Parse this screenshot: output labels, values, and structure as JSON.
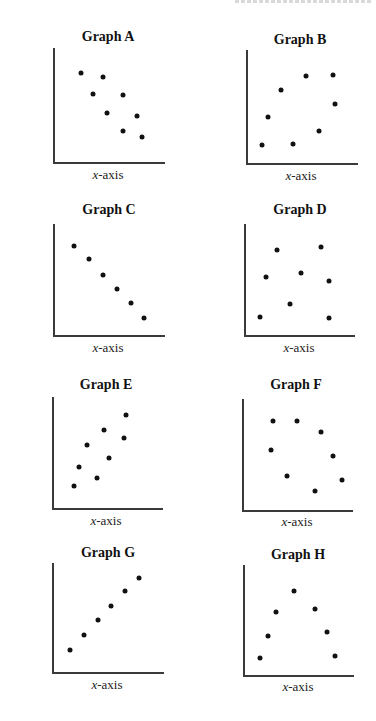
{
  "page": {
    "header_partial_text": ""
  },
  "graphs": [
    {
      "id": "A",
      "title": "Graph A",
      "ylabel_var": "y",
      "ylabel_rest": "-axis",
      "xlabel_var": "x",
      "xlabel_rest": "-axis",
      "trend": "negative",
      "box": {
        "x0": 53,
        "ytop": 48,
        "ybot": 162,
        "x1": 165
      },
      "title_pos": {
        "x": 108,
        "y": 29
      },
      "ylabel_pos": {
        "right": 49,
        "y": 107
      },
      "xlabel_pos": {
        "x": 108,
        "y": 167
      },
      "points": [
        [
          81,
          73
        ],
        [
          103,
          77
        ],
        [
          93,
          94
        ],
        [
          123,
          95
        ],
        [
          107,
          113
        ],
        [
          137,
          116
        ],
        [
          123,
          131
        ],
        [
          142,
          137
        ]
      ]
    },
    {
      "id": "B",
      "title": "Graph B",
      "ylabel_var": "x",
      "ylabel_rest": "-axis",
      "xlabel_var": "x",
      "xlabel_rest": "-axis",
      "trend": "positive-weak",
      "box": {
        "x0": 246,
        "ytop": 50,
        "ybot": 163,
        "x1": 358
      },
      "title_pos": {
        "x": 300,
        "y": 32
      },
      "ylabel_pos": {
        "right": 242,
        "y": 106
      },
      "xlabel_pos": {
        "x": 301,
        "y": 168
      },
      "points": [
        [
          262,
          145
        ],
        [
          293,
          144
        ],
        [
          268,
          117
        ],
        [
          281,
          90
        ],
        [
          306,
          76
        ],
        [
          319,
          131
        ],
        [
          333,
          75
        ],
        [
          335,
          104
        ]
      ]
    },
    {
      "id": "C",
      "title": "Graph C",
      "ylabel_var": "y",
      "ylabel_rest": "-axis",
      "xlabel_var": "x",
      "xlabel_rest": "-axis",
      "trend": "negative-perfect",
      "box": {
        "x0": 53,
        "ytop": 224,
        "ybot": 335,
        "x1": 165
      },
      "title_pos": {
        "x": 109,
        "y": 202
      },
      "ylabel_pos": {
        "right": 49,
        "y": 279
      },
      "xlabel_pos": {
        "x": 108,
        "y": 340
      },
      "points": [
        [
          74,
          246
        ],
        [
          89,
          259
        ],
        [
          103,
          275
        ],
        [
          117,
          289
        ],
        [
          131,
          303
        ],
        [
          144,
          318
        ]
      ]
    },
    {
      "id": "D",
      "title": "Graph D",
      "ylabel_var": "y",
      "ylabel_rest": "-axis",
      "xlabel_var": "x",
      "xlabel_rest": "-axis",
      "trend": "none",
      "box": {
        "x0": 244,
        "ytop": 224,
        "ybot": 335,
        "x1": 355
      },
      "title_pos": {
        "x": 300,
        "y": 202
      },
      "ylabel_pos": {
        "right": 240,
        "y": 281
      },
      "xlabel_pos": {
        "x": 299,
        "y": 340
      },
      "points": [
        [
          277,
          250
        ],
        [
          321,
          247
        ],
        [
          266,
          277
        ],
        [
          301,
          273
        ],
        [
          329,
          281
        ],
        [
          290,
          304
        ],
        [
          260,
          317
        ],
        [
          329,
          318
        ]
      ]
    },
    {
      "id": "E",
      "title": "Graph E",
      "ylabel_var": "y",
      "ylabel_rest": "-axis",
      "xlabel_var": "x",
      "xlabel_rest": "-axis",
      "trend": "positive",
      "box": {
        "x0": 52,
        "ytop": 397,
        "ybot": 508,
        "x1": 163
      },
      "title_pos": {
        "x": 106,
        "y": 377
      },
      "ylabel_pos": {
        "right": 47,
        "y": 452
      },
      "xlabel_pos": {
        "x": 106,
        "y": 513
      },
      "points": [
        [
          74,
          486
        ],
        [
          79,
          467
        ],
        [
          97,
          478
        ],
        [
          87,
          445
        ],
        [
          109,
          458
        ],
        [
          104,
          430
        ],
        [
          124,
          438
        ],
        [
          126,
          415
        ]
      ]
    },
    {
      "id": "F",
      "title": "Graph F",
      "ylabel_var": "y",
      "ylabel_rest": "-axis",
      "xlabel_var": "x",
      "xlabel_rest": "-axis",
      "trend": "negative-weak",
      "box": {
        "x0": 242,
        "ytop": 399,
        "ybot": 510,
        "x1": 353
      },
      "title_pos": {
        "x": 296,
        "y": 377
      },
      "ylabel_pos": {
        "right": 238,
        "y": 453
      },
      "xlabel_pos": {
        "x": 297,
        "y": 514
      },
      "points": [
        [
          273,
          421
        ],
        [
          297,
          421
        ],
        [
          321,
          432
        ],
        [
          271,
          450
        ],
        [
          333,
          456
        ],
        [
          287,
          476
        ],
        [
          342,
          480
        ],
        [
          315,
          491
        ]
      ]
    },
    {
      "id": "G",
      "title": "Graph G",
      "ylabel_var": "y",
      "ylabel_rest": "-axis",
      "xlabel_var": "x",
      "xlabel_rest": "-axis",
      "trend": "positive-perfect",
      "box": {
        "x0": 52,
        "ytop": 563,
        "ybot": 672,
        "x1": 164
      },
      "title_pos": {
        "x": 108,
        "y": 545
      },
      "ylabel_pos": {
        "right": 47,
        "y": 618
      },
      "xlabel_pos": {
        "x": 107,
        "y": 677
      },
      "points": [
        [
          70,
          650
        ],
        [
          84,
          635
        ],
        [
          98,
          620
        ],
        [
          111,
          606
        ],
        [
          125,
          591
        ],
        [
          139,
          578
        ]
      ]
    },
    {
      "id": "H",
      "title": "Graph H",
      "ylabel_var": "y",
      "ylabel_rest": "-axis",
      "xlabel_var": "x",
      "xlabel_rest": "-axis",
      "trend": "curvilinear",
      "box": {
        "x0": 243,
        "ytop": 565,
        "ybot": 675,
        "x1": 354
      },
      "title_pos": {
        "x": 298,
        "y": 547
      },
      "ylabel_pos": {
        "right": 239,
        "y": 621
      },
      "xlabel_pos": {
        "x": 298,
        "y": 679
      },
      "points": [
        [
          260,
          658
        ],
        [
          268,
          636
        ],
        [
          276,
          612
        ],
        [
          294,
          591
        ],
        [
          315,
          609
        ],
        [
          327,
          632
        ],
        [
          335,
          656
        ]
      ]
    }
  ],
  "chart_data": [
    {
      "type": "scatter",
      "title": "Graph A",
      "xlabel": "x-axis",
      "ylabel": "y-axis",
      "grid": false,
      "x": [
        1.5,
        3.2,
        2.4,
        4.8,
        3.6,
        5.9,
        4.8,
        6.3
      ],
      "y": [
        7.7,
        7.4,
        5.9,
        5.8,
        4.3,
        4.0,
        2.7,
        2.2
      ]
    },
    {
      "type": "scatter",
      "title": "Graph B",
      "xlabel": "x-axis",
      "ylabel": "x-axis",
      "grid": false,
      "x": [
        1.2,
        3.7,
        1.8,
        2.8,
        4.8,
        5.8,
        6.9,
        7.0
      ],
      "y": [
        1.6,
        1.7,
        4.0,
        6.4,
        7.6,
        2.8,
        7.7,
        5.2
      ]
    },
    {
      "type": "scatter",
      "title": "Graph C",
      "xlabel": "x-axis",
      "ylabel": "y-axis",
      "grid": false,
      "x": [
        1.9,
        3.2,
        4.5,
        5.8,
        7.0,
        8.2
      ],
      "y": [
        8.0,
        6.8,
        5.4,
        4.1,
        2.9,
        1.5
      ]
    },
    {
      "type": "scatter",
      "title": "Graph D",
      "xlabel": "x-axis",
      "ylabel": "y-axis",
      "grid": false,
      "x": [
        3.0,
        6.9,
        2.0,
        5.1,
        7.6,
        4.1,
        1.4,
        7.6
      ],
      "y": [
        7.7,
        8.0,
        5.3,
        5.6,
        4.9,
        2.8,
        1.6,
        1.5
      ]
    },
    {
      "type": "scatter",
      "title": "Graph E",
      "xlabel": "x-axis",
      "ylabel": "y-axis",
      "grid": false,
      "x": [
        2.0,
        2.4,
        4.1,
        3.2,
        5.2,
        4.7,
        6.5,
        6.7
      ],
      "y": [
        2.0,
        3.7,
        2.7,
        5.7,
        4.5,
        7.0,
        6.3,
        8.4
      ]
    },
    {
      "type": "scatter",
      "title": "Graph F",
      "xlabel": "x-axis",
      "ylabel": "y-axis",
      "grid": false,
      "x": [
        2.8,
        5.0,
        7.1,
        2.6,
        8.2,
        4.1,
        9.0,
        6.6
      ],
      "y": [
        8.0,
        8.0,
        7.0,
        5.4,
        4.9,
        3.1,
        2.7,
        1.7
      ]
    },
    {
      "type": "scatter",
      "title": "Graph G",
      "xlabel": "x-axis",
      "ylabel": "y-axis",
      "grid": false,
      "x": [
        1.6,
        2.9,
        4.1,
        5.3,
        6.5,
        7.8
      ],
      "y": [
        2.0,
        3.4,
        4.8,
        6.1,
        7.5,
        8.7
      ]
    },
    {
      "type": "scatter",
      "title": "Graph H",
      "xlabel": "x-axis",
      "ylabel": "y-axis",
      "grid": false,
      "x": [
        1.5,
        2.3,
        3.0,
        4.6,
        6.5,
        7.6,
        8.3
      ],
      "y": [
        1.5,
        3.5,
        5.7,
        7.6,
        6.0,
        3.9,
        1.7
      ]
    }
  ]
}
